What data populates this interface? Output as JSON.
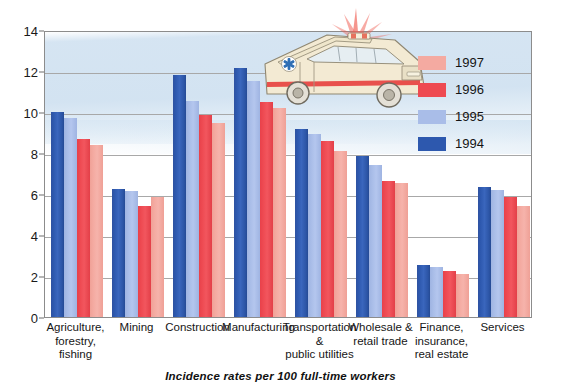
{
  "chart_data": {
    "type": "bar",
    "title": "",
    "subtitle": "",
    "xlabel": "",
    "ylabel": "",
    "caption": "Incidence rates per 100 full-time workers",
    "ylim": [
      0,
      14
    ],
    "yticks": [
      0,
      2,
      4,
      6,
      8,
      10,
      12,
      14
    ],
    "ytick_labels": [
      "0",
      "2",
      "4",
      "6",
      "8",
      "10",
      "12",
      "14"
    ],
    "grid": "horizontal",
    "legend_position": "top-right",
    "categories": [
      "Agriculture,\nforestry,\nfishing",
      "Mining",
      "Construction",
      "Manufacturing",
      "Transportation\n&\npublic utilities",
      "Wholesale &\nretail trade",
      "Finance,\ninsurance,\nreal estate",
      "Services"
    ],
    "series": [
      {
        "name": "1994",
        "color": "#2d58ae",
        "values": [
          10.0,
          6.25,
          11.8,
          12.15,
          9.15,
          7.85,
          2.55,
          6.35
        ]
      },
      {
        "name": "1995",
        "color": "#a9bde8",
        "values": [
          9.7,
          6.15,
          10.55,
          11.5,
          8.95,
          7.4,
          2.45,
          6.2
        ]
      },
      {
        "name": "1996",
        "color": "#ee4a52",
        "values": [
          8.7,
          5.4,
          9.85,
          10.5,
          8.6,
          6.65,
          2.25,
          5.85
        ]
      },
      {
        "name": "1997",
        "color": "#f4aaa1",
        "values": [
          8.4,
          5.85,
          9.45,
          10.2,
          8.1,
          6.55,
          2.1,
          5.4
        ]
      }
    ],
    "legend": [
      {
        "label": "1997",
        "color": "#f4aaa1"
      },
      {
        "label": "1996",
        "color": "#ee4a52"
      },
      {
        "label": "1995",
        "color": "#a9bde8"
      },
      {
        "label": "1994",
        "color": "#2d58ae"
      }
    ]
  },
  "illustration": {
    "name": "ambulance-illustration",
    "description": "ambulance with flashing red emergency lights"
  }
}
